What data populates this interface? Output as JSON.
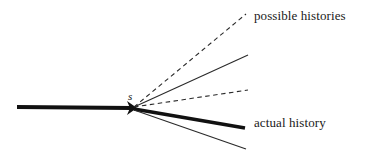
{
  "figure": {
    "name": "branching-histories-diagram",
    "background_color": "#ffffff",
    "stroke_color": "#111111",
    "vertex_label": "s",
    "incoming": {
      "name": "incoming-history-line",
      "style": "solid-thick",
      "x1": 17,
      "y1": 107,
      "x2": 133,
      "y2": 108,
      "width": 4.2,
      "arrowhead": true
    },
    "branches": [
      {
        "name": "possible-history-branch-1",
        "style": "dashed",
        "x1": 134,
        "y1": 107,
        "x2": 246,
        "y2": 14,
        "width": 1.1
      },
      {
        "name": "possible-history-branch-2",
        "style": "solid-thin",
        "x1": 134,
        "y1": 107,
        "x2": 248,
        "y2": 55,
        "width": 1.1
      },
      {
        "name": "possible-history-branch-3",
        "style": "dashed",
        "x1": 134,
        "y1": 107,
        "x2": 248,
        "y2": 90,
        "width": 1.1
      },
      {
        "name": "actual-history-branch",
        "style": "solid-thick",
        "x1": 134,
        "y1": 109,
        "x2": 245,
        "y2": 128,
        "width": 3.6
      },
      {
        "name": "possible-history-branch-4",
        "style": "solid-thin",
        "x1": 134,
        "y1": 110,
        "x2": 246,
        "y2": 149,
        "width": 1.1
      }
    ],
    "labels": {
      "possible_histories": "possible histories",
      "actual_history": "actual history"
    }
  }
}
